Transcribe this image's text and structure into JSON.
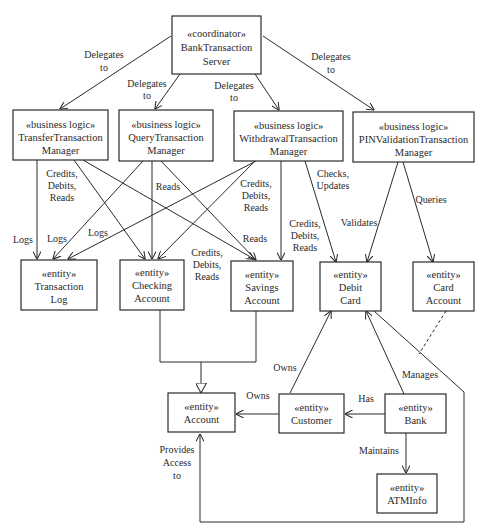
{
  "diagram": {
    "type": "UML class diagram",
    "nodes": {
      "server": {
        "stereotype": "«coordinator»",
        "line1": "BankTransaction",
        "line2": "Server"
      },
      "transfer": {
        "stereotype": "«business logic»",
        "line1": "TransferTransaction",
        "line2": "Manager"
      },
      "query": {
        "stereotype": "«business logic»",
        "line1": "QueryTransaction",
        "line2": "Manager"
      },
      "withdrawal": {
        "stereotype": "«business logic»",
        "line1": "WithdrawalTransaction",
        "line2": "Manager"
      },
      "pin": {
        "stereotype": "«business logic»",
        "line1": "PINValidationTransaction",
        "line2": "Manager"
      },
      "txlog": {
        "stereotype": "«entity»",
        "line1": "Transaction",
        "line2": "Log"
      },
      "checking": {
        "stereotype": "«entity»",
        "line1": "Checking",
        "line2": "Account"
      },
      "savings": {
        "stereotype": "«entity»",
        "line1": "Savings",
        "line2": "Account"
      },
      "debit": {
        "stereotype": "«entity»",
        "line1": "Debit",
        "line2": "Card"
      },
      "cardacct": {
        "stereotype": "«entity»",
        "line1": "Card",
        "line2": "Account"
      },
      "account": {
        "stereotype": "«entity»",
        "line1": "Account"
      },
      "customer": {
        "stereotype": "«entity»",
        "line1": "Customer"
      },
      "bank": {
        "stereotype": "«entity»",
        "line1": "Bank"
      },
      "atminfo": {
        "stereotype": "«entity»",
        "line1": "ATMInfo"
      }
    },
    "labels": {
      "delegates_transfer": [
        "Delegates",
        "to"
      ],
      "delegates_query": [
        "Delegates",
        "to"
      ],
      "delegates_withdrawal": [
        "Delegates",
        "to"
      ],
      "delegates_pin": [
        "Delegates",
        "to"
      ],
      "transfer_cdr": [
        "Credits,",
        "Debits,",
        "Reads"
      ],
      "transfer_logs": "Logs",
      "query_logs": "Logs",
      "withdrawal_logs": "Logs",
      "query_reads_checking": "Reads",
      "query_reads_savings": "Reads",
      "withdrawal_cdr_checking": [
        "Credits,",
        "Debits,",
        "Reads"
      ],
      "transfer_cdr_savings": [
        "Credits,",
        "Debits,",
        "Reads"
      ],
      "withdrawal_cdr_savings": [
        "Credits,",
        "Debits,",
        "Reads"
      ],
      "checks_updates": [
        "Checks,",
        "Updates"
      ],
      "validates": "Validates",
      "queries": "Queries",
      "customer_owns_debit": "Owns",
      "customer_owns_account": "Owns",
      "bank_has_customer": "Has",
      "bank_manages_debit": "Manages",
      "bank_maintains_atminfo": "Maintains",
      "debit_provides_access": [
        "Provides",
        "Access",
        "to"
      ]
    },
    "edges": [
      {
        "from": "server",
        "to": "transfer",
        "label": "Delegates to"
      },
      {
        "from": "server",
        "to": "query",
        "label": "Delegates to"
      },
      {
        "from": "server",
        "to": "withdrawal",
        "label": "Delegates to"
      },
      {
        "from": "server",
        "to": "pin",
        "label": "Delegates to"
      },
      {
        "from": "transfer",
        "to": "txlog",
        "label": "Logs"
      },
      {
        "from": "transfer",
        "to": "checking",
        "label": "Credits, Debits, Reads"
      },
      {
        "from": "transfer",
        "to": "savings",
        "label": "Credits, Debits, Reads"
      },
      {
        "from": "query",
        "to": "txlog",
        "label": "Logs"
      },
      {
        "from": "query",
        "to": "checking",
        "label": "Reads"
      },
      {
        "from": "query",
        "to": "savings",
        "label": "Reads"
      },
      {
        "from": "withdrawal",
        "to": "txlog",
        "label": "Logs"
      },
      {
        "from": "withdrawal",
        "to": "checking",
        "label": "Credits, Debits, Reads"
      },
      {
        "from": "withdrawal",
        "to": "savings",
        "label": "Credits, Debits, Reads"
      },
      {
        "from": "withdrawal",
        "to": "debit",
        "label": "Checks, Updates"
      },
      {
        "from": "pin",
        "to": "debit",
        "label": "Validates"
      },
      {
        "from": "pin",
        "to": "cardacct",
        "label": "Queries"
      },
      {
        "from": "checking",
        "to": "account",
        "label": "generalization"
      },
      {
        "from": "savings",
        "to": "account",
        "label": "generalization"
      },
      {
        "from": "customer",
        "to": "debit",
        "label": "Owns"
      },
      {
        "from": "customer",
        "to": "account",
        "label": "Owns"
      },
      {
        "from": "bank",
        "to": "customer",
        "label": "Has"
      },
      {
        "from": "bank",
        "to": "debit",
        "label": "Manages"
      },
      {
        "from": "bank",
        "to": "atminfo",
        "label": "Maintains"
      },
      {
        "from": "debit",
        "to": "account",
        "label": "Provides Access to"
      },
      {
        "from": "cardacct",
        "to": "debit-bank association",
        "label": "association class (dashed)"
      }
    ]
  }
}
